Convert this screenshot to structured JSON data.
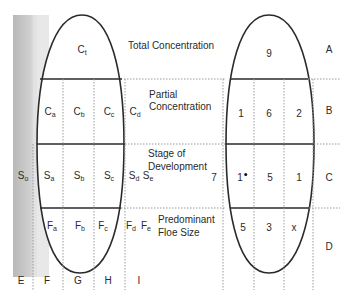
{
  "diagram": {
    "colors": {
      "ink": "#2a2a2a",
      "shade": "#c9c9c9",
      "dotted": "#9a9a9a"
    },
    "left_egg": {
      "total_concentration": {
        "base": "C",
        "sub": "t"
      },
      "partial_concentration": [
        {
          "base": "C",
          "sub": "a"
        },
        {
          "base": "C",
          "sub": "b"
        },
        {
          "base": "C",
          "sub": "c"
        },
        {
          "base": "C",
          "sub": "d"
        }
      ],
      "stage_of_development": [
        {
          "base": "S",
          "sub": "o"
        },
        {
          "base": "S",
          "sub": "a"
        },
        {
          "base": "S",
          "sub": "b"
        },
        {
          "base": "S",
          "sub": "c"
        },
        {
          "base": "S",
          "sub": "d"
        },
        {
          "base": "S",
          "sub": "e"
        }
      ],
      "floe_size": [
        {
          "base": "F",
          "sub": "a"
        },
        {
          "base": "F",
          "sub": "b"
        },
        {
          "base": "F",
          "sub": "c"
        },
        {
          "base": "F",
          "sub": "d"
        },
        {
          "base": "F",
          "sub": "e"
        }
      ],
      "column_labels": [
        "E",
        "F",
        "G",
        "H",
        "I"
      ]
    },
    "descriptions": {
      "total": "Total Concentration",
      "partial_line1": "Partial",
      "partial_line2": "Concentration",
      "stage_line1": "Stage of",
      "stage_line2": "Development",
      "floe_line1": "Predominant",
      "floe_line2": "Floe Size"
    },
    "right_egg": {
      "total_concentration": "9",
      "partial_concentration": [
        "1",
        "6",
        "2"
      ],
      "stage_outside": "7",
      "stage_of_development": [
        "1",
        "5",
        "1"
      ],
      "floe_size": [
        "5",
        "3",
        "x"
      ],
      "row_labels": [
        "A",
        "B",
        "C",
        "D"
      ]
    }
  }
}
